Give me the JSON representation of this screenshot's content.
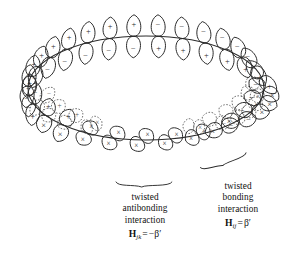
{
  "figure": {
    "ring": {
      "shape": "ellipse",
      "center": [
        146,
        88
      ],
      "radius_x": 118,
      "radius_y": 52,
      "stroke": "#2b2b2b",
      "note": "closed loop along which p orbitals are mounted; loop contains one half twist"
    },
    "colors": {
      "ink": "#2b2b2b",
      "text": "#111111",
      "background": "#ffffff",
      "ghost_outline": "#5a5a5a"
    },
    "lobe_sign_symbols": {
      "positive": "+",
      "negative": "−",
      "end_on": "×"
    },
    "legend_note": "× marks a lobe viewed end-on (pointing toward the viewer); + and − mark lobes seen broadside",
    "ghost_note": "dotted outlines show the orbital positions before the twist"
  },
  "orbitals": [
    {
      "id": 1,
      "angle_deg": 182,
      "front": "+",
      "back": "−",
      "view": "side",
      "tilt_deg": 6,
      "ghost": false
    },
    {
      "id": 2,
      "angle_deg": 193,
      "front": "+",
      "back": "−",
      "view": "side",
      "tilt_deg": 12,
      "ghost": false
    },
    {
      "id": 3,
      "angle_deg": 204,
      "front": "+",
      "back": "−",
      "view": "side",
      "tilt_deg": 16,
      "ghost": false
    },
    {
      "id": 4,
      "angle_deg": 216,
      "front": "+",
      "back": "−",
      "view": "side",
      "tilt_deg": 14,
      "ghost": false
    },
    {
      "id": 5,
      "angle_deg": 228,
      "front": "+",
      "back": "−",
      "view": "side",
      "tilt_deg": 10,
      "ghost": false
    },
    {
      "id": 6,
      "angle_deg": 240,
      "front": "+",
      "back": "−",
      "view": "side",
      "tilt_deg": 6,
      "ghost": false
    },
    {
      "id": 7,
      "angle_deg": 252,
      "front": "+",
      "back": "−",
      "view": "side",
      "tilt_deg": 3,
      "ghost": false
    },
    {
      "id": 8,
      "angle_deg": 264,
      "front": "+",
      "back": "−",
      "view": "side",
      "tilt_deg": 1,
      "ghost": false
    },
    {
      "id": 9,
      "angle_deg": 276,
      "front": "−",
      "back": "+",
      "view": "side",
      "tilt_deg": -1,
      "ghost": false
    },
    {
      "id": 10,
      "angle_deg": 288,
      "front": "−",
      "back": "+",
      "view": "side",
      "tilt_deg": -3,
      "ghost": false
    },
    {
      "id": 11,
      "angle_deg": 300,
      "front": "−",
      "back": "+",
      "view": "side",
      "tilt_deg": -7,
      "ghost": false
    },
    {
      "id": 12,
      "angle_deg": 312,
      "front": "−",
      "back": "+",
      "view": "side",
      "tilt_deg": -12,
      "ghost": false
    },
    {
      "id": 13,
      "angle_deg": 324,
      "front": "−",
      "back": "+",
      "view": "side",
      "tilt_deg": -20,
      "ghost": false
    },
    {
      "id": 14,
      "angle_deg": 336,
      "front": "−",
      "back": "+",
      "view": "side",
      "tilt_deg": -30,
      "ghost": false
    },
    {
      "id": 15,
      "angle_deg": 348,
      "front": "−",
      "back": "+",
      "view": "side",
      "tilt_deg": -42,
      "ghost": false
    },
    {
      "id": 16,
      "angle_deg": 2,
      "front": "−",
      "back": "×",
      "view": "rotating",
      "tilt_deg": -56,
      "ghost": true
    },
    {
      "id": 17,
      "angle_deg": 14,
      "front": "−",
      "back": "×",
      "view": "rotating",
      "tilt_deg": -70,
      "ghost": true
    },
    {
      "id": 18,
      "angle_deg": 26,
      "front": "−",
      "back": "×",
      "view": "rotating",
      "tilt_deg": -84,
      "ghost": true
    },
    {
      "id": 19,
      "angle_deg": 38,
      "front": "×",
      "back": "−",
      "view": "rotating",
      "tilt_deg": -96,
      "ghost": true
    },
    {
      "id": 20,
      "angle_deg": 50,
      "front": "×",
      "back": "−",
      "view": "rotating",
      "tilt_deg": -108,
      "ghost": true
    },
    {
      "id": 21,
      "angle_deg": 64,
      "front": "×",
      "back": "×",
      "view": "end-on",
      "tilt_deg": -118,
      "ghost": true
    },
    {
      "id": 22,
      "angle_deg": 78,
      "front": "×",
      "back": "×",
      "view": "end-on",
      "tilt_deg": -126,
      "ghost": false
    },
    {
      "id": 23,
      "angle_deg": 92,
      "front": "×",
      "back": "×",
      "view": "end-on",
      "tilt_deg": -132,
      "ghost": false
    },
    {
      "id": 24,
      "angle_deg": 106,
      "front": "×",
      "back": "×",
      "view": "end-on",
      "tilt_deg": -138,
      "ghost": false
    },
    {
      "id": 25,
      "angle_deg": 120,
      "front": "×",
      "back": "×",
      "view": "end-on",
      "tilt_deg": -146,
      "ghost": true
    },
    {
      "id": 26,
      "angle_deg": 134,
      "front": "×",
      "back": "+",
      "view": "rotating",
      "tilt_deg": -156,
      "ghost": true
    },
    {
      "id": 27,
      "angle_deg": 148,
      "front": "×",
      "back": "+",
      "view": "rotating",
      "tilt_deg": -166,
      "ghost": true
    },
    {
      "id": 28,
      "angle_deg": 162,
      "front": "+",
      "back": "−",
      "view": "side",
      "tilt_deg": -174,
      "ghost": true
    },
    {
      "id": 29,
      "angle_deg": 172,
      "front": "+",
      "back": "−",
      "view": "side",
      "tilt_deg": 2,
      "ghost": false
    }
  ],
  "annotations": {
    "antibonding": {
      "brace": {
        "x": 116,
        "y": 182,
        "width": 56,
        "rotation_deg": 0
      },
      "lines": [
        "twisted",
        "antibonding",
        "interaction"
      ],
      "formula": {
        "symbol": "H",
        "subscript": "jk",
        "relation": "=",
        "value": "−β′",
        "full": "Hⱼₖ = −β′"
      }
    },
    "bonding": {
      "brace": {
        "x": 200,
        "y": 160,
        "width": 48,
        "rotation_deg": -18
      },
      "lines": [
        "twisted",
        "bonding",
        "interaction"
      ],
      "formula": {
        "symbol": "H",
        "subscript": "ij",
        "relation": "=",
        "value": "β′",
        "full": "Hᵢⱼ = β′"
      }
    }
  }
}
